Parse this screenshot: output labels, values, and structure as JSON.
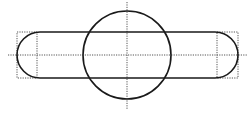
{
  "diagram": {
    "width": 251,
    "height": 113,
    "colors": {
      "outline": "#1a1a1a",
      "guide": "#555555",
      "background": "#ffffff"
    },
    "stadium": {
      "x": 17,
      "y": 32,
      "width": 221,
      "height": 46,
      "radius": 23
    },
    "circle": {
      "cx": 127,
      "cy": 55,
      "r": 44
    },
    "guides": {
      "horizontal_axis": {
        "x1": 8,
        "y1": 55,
        "x2": 248,
        "y2": 55
      },
      "vertical_axis": {
        "x1": 127,
        "y1": 2,
        "x2": 127,
        "y2": 109
      },
      "left_box": {
        "x": 17,
        "y": 32,
        "width": 20,
        "height": 46
      },
      "right_box": {
        "x": 217,
        "y": 32,
        "width": 21,
        "height": 46
      }
    }
  }
}
